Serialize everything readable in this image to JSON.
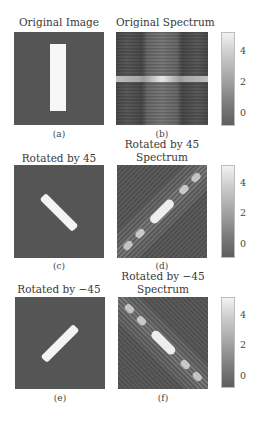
{
  "figure": {
    "rows": [
      {
        "left": {
          "title": "Original Image",
          "label": "(a)"
        },
        "right": {
          "title_line1": "Original Spectrum",
          "title_line2": "",
          "label": "(b)"
        },
        "colorbar": {
          "ticks": [
            "4",
            "2",
            "0"
          ]
        }
      },
      {
        "left": {
          "title": "Rotated by 45",
          "label": "(c)"
        },
        "right": {
          "title_line1": "Rotated by 45",
          "title_line2": "Spectrum",
          "label": "(d)"
        },
        "colorbar": {
          "ticks": [
            "4",
            "2",
            "0"
          ]
        }
      },
      {
        "left": {
          "title": "Rotated by −45",
          "label": "(e)"
        },
        "right": {
          "title_line1": "Rotated by −45",
          "title_line2": "Spectrum",
          "label": "(f)"
        },
        "colorbar": {
          "ticks": [
            "4",
            "2",
            "0"
          ]
        }
      }
    ],
    "colors": {
      "panel_bg": "#555555",
      "bright": "#f4f4f4",
      "colorbar_top": "#f2f2f2",
      "colorbar_bottom": "#5e5e5e"
    }
  }
}
